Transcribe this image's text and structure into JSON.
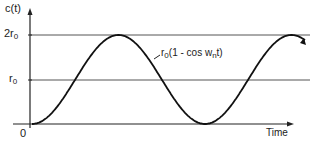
{
  "chart_data": {
    "type": "line",
    "title": "",
    "xlabel": "Time",
    "ylabel": "c(t)",
    "yticks": [
      {
        "label": "0",
        "value": 0
      },
      {
        "label": "r0",
        "value": 1
      },
      {
        "label": "2r0",
        "value": 2
      }
    ],
    "reference_lines": [
      {
        "label": "r0",
        "value": 1
      },
      {
        "label": "2r0",
        "value": 2
      }
    ],
    "series": [
      {
        "name": "r0(1 - cos wn t)",
        "description": "Undamped oscillation between 0 and 2r0",
        "x_phase_radians": [
          0,
          1.5708,
          3.1416,
          4.7124,
          6.2832,
          7.854,
          9.4248,
          10.0
        ],
        "y_normalized": [
          0,
          1,
          2,
          1,
          0,
          1,
          2,
          1.84
        ]
      }
    ],
    "annotation": "r0(1 - cos wn t)",
    "ylim": [
      0,
      2
    ],
    "grid": false,
    "legend": "none"
  },
  "labels": {
    "y_axis": "c(t)",
    "x_axis": "Time",
    "tick_2r0_main": "2r",
    "tick_2r0_sub": "0",
    "tick_r0_main": "r",
    "tick_r0_sub": "0",
    "origin": "0",
    "annotation_prefix": "r",
    "annotation_sub": "0",
    "annotation_mid": "(1 - cos w",
    "annotation_sub2": "n",
    "annotation_suffix": "t)"
  }
}
